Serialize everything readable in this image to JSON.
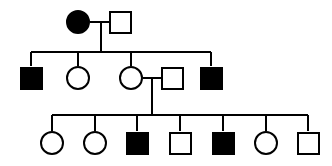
{
  "diagram": {
    "type": "pedigree-chart",
    "background_color": "#ffffff",
    "stroke_color": "#000000",
    "fill_affected_color": "#000000",
    "fill_unaffected_color": "#ffffff",
    "stroke_width": 2,
    "symbol_legend": {
      "circle": "female",
      "square": "male",
      "filled": "affected",
      "open": "unaffected"
    },
    "generations": [
      {
        "id": "generation-1",
        "label": "I",
        "symbol_center_y": 22,
        "members": [
          {
            "id": "I-1",
            "shape": "circle",
            "sex": "female",
            "status": "affected",
            "filled": true,
            "cx": 78,
            "cy": 22,
            "size": 24
          },
          {
            "id": "I-2",
            "shape": "square",
            "sex": "male",
            "status": "unaffected",
            "filled": false,
            "cx": 120,
            "cy": 22,
            "size": 23
          }
        ],
        "mating_lines": [
          {
            "id": "mating-I",
            "x1": 90,
            "x2": 109,
            "y": 22
          }
        ],
        "descent_lines": [
          {
            "id": "descent-I",
            "x": 101,
            "y1": 22,
            "y2": 52
          }
        ]
      },
      {
        "id": "generation-2",
        "label": "II",
        "symbol_center_y": 78,
        "sibship_line": {
          "id": "sibship-II",
          "x1": 31,
          "x2": 211,
          "y": 52
        },
        "members": [
          {
            "id": "II-1",
            "shape": "square",
            "sex": "male",
            "status": "affected",
            "filled": true,
            "cx": 31,
            "cy": 78,
            "size": 23,
            "drop_line": {
              "x": 31,
              "y1": 52,
              "y2": 66
            }
          },
          {
            "id": "II-2",
            "shape": "circle",
            "sex": "female",
            "status": "unaffected",
            "filled": false,
            "cx": 78,
            "cy": 78,
            "size": 24,
            "drop_line": {
              "x": 78,
              "y1": 52,
              "y2": 66
            }
          },
          {
            "id": "II-3",
            "shape": "circle",
            "sex": "female",
            "status": "unaffected",
            "filled": false,
            "cx": 131,
            "cy": 78,
            "size": 24,
            "drop_line": {
              "x": 131,
              "y1": 52,
              "y2": 66
            }
          },
          {
            "id": "II-4",
            "shape": "square",
            "sex": "male",
            "status": "unaffected",
            "filled": false,
            "cx": 172,
            "cy": 78,
            "size": 23,
            "married_in": true
          },
          {
            "id": "II-5",
            "shape": "square",
            "sex": "male",
            "status": "affected",
            "filled": true,
            "cx": 211,
            "cy": 78,
            "size": 23,
            "drop_line": {
              "x": 211,
              "y1": 52,
              "y2": 66
            }
          }
        ],
        "mating_lines": [
          {
            "id": "mating-II",
            "x1": 143,
            "x2": 161,
            "y": 78
          }
        ],
        "descent_lines": [
          {
            "id": "descent-II",
            "x": 152,
            "y1": 78,
            "y2": 115
          }
        ]
      },
      {
        "id": "generation-3",
        "label": "III",
        "symbol_center_y": 143,
        "sibship_line": {
          "id": "sibship-III",
          "x1": 52,
          "x2": 308,
          "y": 115
        },
        "members": [
          {
            "id": "III-1",
            "shape": "circle",
            "sex": "female",
            "status": "unaffected",
            "filled": false,
            "cx": 52,
            "cy": 143,
            "size": 24,
            "drop_line": {
              "x": 52,
              "y1": 115,
              "y2": 131
            }
          },
          {
            "id": "III-2",
            "shape": "circle",
            "sex": "female",
            "status": "unaffected",
            "filled": false,
            "cx": 95,
            "cy": 143,
            "size": 24,
            "drop_line": {
              "x": 95,
              "y1": 115,
              "y2": 131
            }
          },
          {
            "id": "III-3",
            "shape": "square",
            "sex": "male",
            "status": "affected",
            "filled": true,
            "cx": 137,
            "cy": 143,
            "size": 23,
            "drop_line": {
              "x": 137,
              "y1": 115,
              "y2": 131
            }
          },
          {
            "id": "III-4",
            "shape": "square",
            "sex": "male",
            "status": "unaffected",
            "filled": false,
            "cx": 180,
            "cy": 143,
            "size": 23,
            "drop_line": {
              "x": 180,
              "y1": 115,
              "y2": 131
            }
          },
          {
            "id": "III-5",
            "shape": "square",
            "sex": "male",
            "status": "affected",
            "filled": true,
            "cx": 223,
            "cy": 143,
            "size": 23,
            "drop_line": {
              "x": 223,
              "y1": 115,
              "y2": 131
            }
          },
          {
            "id": "III-6",
            "shape": "circle",
            "sex": "female",
            "status": "unaffected",
            "filled": false,
            "cx": 266,
            "cy": 143,
            "size": 24,
            "drop_line": {
              "x": 266,
              "y1": 115,
              "y2": 131
            }
          },
          {
            "id": "III-7",
            "shape": "square",
            "sex": "male",
            "status": "unaffected",
            "filled": false,
            "cx": 308,
            "cy": 143,
            "size": 23,
            "drop_line": {
              "x": 308,
              "y1": 115,
              "y2": 131
            }
          }
        ]
      }
    ],
    "counts": {
      "total_individuals": 14,
      "affected_individuals": 5,
      "unaffected_individuals": 9,
      "generations": 3
    }
  }
}
